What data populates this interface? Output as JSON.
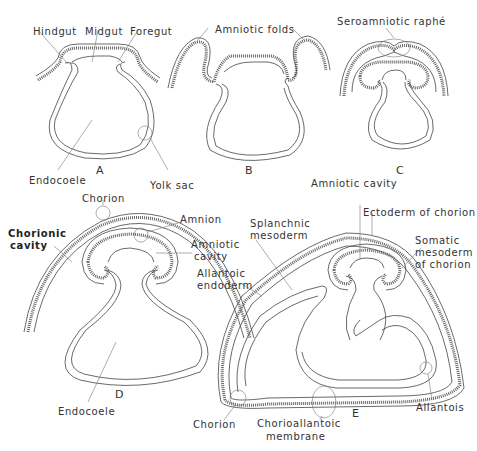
{
  "figure": {
    "panels": [
      {
        "id": "A",
        "label": "A"
      },
      {
        "id": "B",
        "label": "B"
      },
      {
        "id": "C",
        "label": "C"
      },
      {
        "id": "D",
        "label": "D"
      },
      {
        "id": "E",
        "label": "E"
      }
    ],
    "labels": {
      "hindgut": "Hindgut",
      "midgut": "Midgut",
      "foregut": "Foregut",
      "endocoele_a": "Endocoele",
      "yolk_sac": "Yolk sac",
      "amniotic_folds": "Amniotic folds",
      "seroamniotic_raphe": "Seroamniotic raphé",
      "chorion_d": "Chorion",
      "chorionic_cavity_1": "Chorionic",
      "chorionic_cavity_2": "cavity",
      "amnion": "Amnion",
      "amniotic_cavity_d_1": "Amniotic",
      "amniotic_cavity_d_2": "cavity",
      "endocoele_d": "Endocoele",
      "amniotic_cavity_e": "Amniotic cavity",
      "ectoderm_of_chorion": "Ectoderm of chorion",
      "splanchnic_mesoderm_1": "Splanchnic",
      "splanchnic_mesoderm_2": "mesoderm",
      "somatic_mesoderm_1": "Somatic",
      "somatic_mesoderm_2": "mesoderm",
      "somatic_mesoderm_3": "of chorion",
      "allantoic_endoderm_1": "Allantoic",
      "allantoic_endoderm_2": "endoderm",
      "chorion_e": "Chorion",
      "chorioallantoic_1": "Chorioallantoic",
      "chorioallantoic_2": "membrane",
      "allantois": "Allantois"
    }
  }
}
